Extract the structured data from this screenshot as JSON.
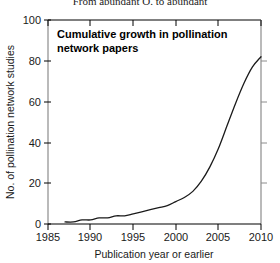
{
  "figure": {
    "clipped_top_caption": "From abundant O. to abundant",
    "plot_title_line1": "Cumulative growth in pollination",
    "plot_title_line2": "network papers",
    "colors": {
      "line": "#1a1a1a",
      "axis_black": "#000000",
      "spine_gray": "#8c8c8c",
      "background": "#ffffff",
      "text": "#1a1a1a"
    }
  },
  "chart_data": {
    "type": "line",
    "xlabel": "Publication year or earlier",
    "ylabel": "No. of pollination network studies",
    "xlim": [
      1985,
      2010
    ],
    "ylim": [
      0,
      100
    ],
    "xticks": [
      1985,
      1990,
      1995,
      2000,
      2005,
      2010
    ],
    "yticks": [
      0,
      20,
      40,
      60,
      80,
      100
    ],
    "grid": false,
    "legend": null,
    "series": [
      {
        "name": "Cumulative pollination network papers",
        "x": [
          1987,
          1988,
          1989,
          1990,
          1991,
          1992,
          1993,
          1994,
          1995,
          1996,
          1997,
          1998,
          1999,
          2000,
          2001,
          2002,
          2003,
          2004,
          2005,
          2006,
          2007,
          2008,
          2009,
          2010
        ],
        "values": [
          1,
          1,
          2,
          2,
          3,
          3,
          4,
          4,
          5,
          6,
          7,
          8,
          9,
          11,
          13,
          16,
          21,
          28,
          37,
          48,
          59,
          69,
          77,
          82
        ]
      }
    ]
  },
  "axis": {
    "xtick_labels": [
      "1985",
      "1990",
      "1995",
      "2000",
      "2005",
      "2010"
    ],
    "ytick_labels": [
      "0",
      "20",
      "40",
      "60",
      "80",
      "100"
    ]
  }
}
